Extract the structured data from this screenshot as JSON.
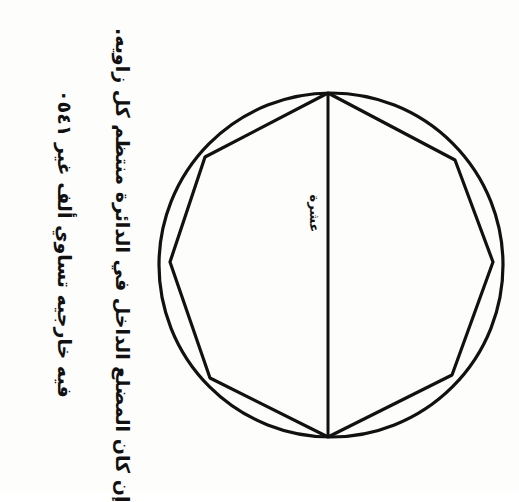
{
  "page": {
    "background_color": "#fdfdfc",
    "ink_color": "#111111",
    "orientation_note": "text rotated 90 degrees"
  },
  "question": {
    "line1": "إن كان المضلع الداخل في الدائرة منتظم كل زاويه.",
    "line2": "فيه خارجيه تساوي ألف غير ١٤٥٠"
  },
  "figure": {
    "inner_label": "عشرة",
    "shape_type": "circle-with-inscribed-polygon",
    "polygon_sides": 8,
    "has_vertical_diameter": true,
    "circle": {
      "cx": 331,
      "cy": 265,
      "r": 172
    },
    "vertices": [
      {
        "x": 328,
        "y": 93
      },
      {
        "x": 455,
        "y": 160
      },
      {
        "x": 493,
        "y": 262
      },
      {
        "x": 452,
        "y": 375
      },
      {
        "x": 328,
        "y": 437
      },
      {
        "x": 210,
        "y": 378
      },
      {
        "x": 170,
        "y": 262
      },
      {
        "x": 205,
        "y": 157
      }
    ],
    "diameter": {
      "x1": 328,
      "y1": 93,
      "x2": 328,
      "y2": 437
    }
  }
}
